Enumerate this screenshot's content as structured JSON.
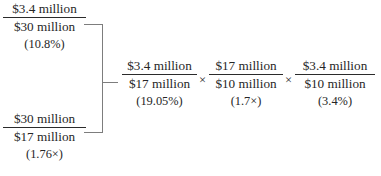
{
  "diagram": {
    "brace_icon": "right-brace-icon",
    "multiplication_symbol": "×",
    "text_color": "#262626",
    "rule_color": "#2b2b2b",
    "brace_color": "#7d7d7d"
  },
  "left_column": {
    "fractions": [
      {
        "numerator": "$3.4 million",
        "denominator": "$30 million",
        "note": "(10.8%)"
      },
      {
        "numerator": "$30 million",
        "denominator": "$17 million",
        "note": "(1.76×)"
      }
    ]
  },
  "right_row": {
    "fractions": [
      {
        "numerator": "$3.4 million",
        "denominator": "$17 million",
        "note": "(19.05%)"
      },
      {
        "numerator": "$17 million",
        "denominator": "$10 million",
        "note": "(1.7×)"
      },
      {
        "numerator": "$3.4 million",
        "denominator": "$10 million",
        "note": "(3.4%)"
      }
    ],
    "operators": [
      "×",
      "×"
    ]
  }
}
